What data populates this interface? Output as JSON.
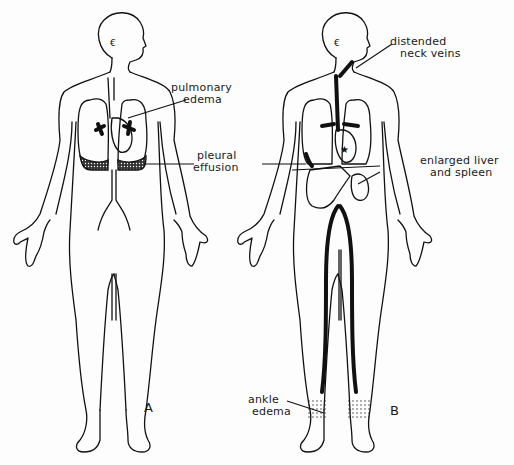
{
  "figure": {
    "background": "#fdfdfd",
    "ink_color": "#111111",
    "panels": [
      {
        "id": "A",
        "label": "A",
        "annotations": [
          {
            "text_line1": "pulmonary",
            "text_line2": "edema"
          },
          {
            "text_line1": "pleural",
            "text_line2": "effusion"
          }
        ]
      },
      {
        "id": "B",
        "label": "B",
        "annotations": [
          {
            "text_line1": "distended",
            "text_line2": "neck veins"
          },
          {
            "text_line1": "enlarged liver",
            "text_line2": "and spleen"
          },
          {
            "text_line1": "ankle",
            "text_line2": "edema"
          }
        ]
      }
    ]
  }
}
